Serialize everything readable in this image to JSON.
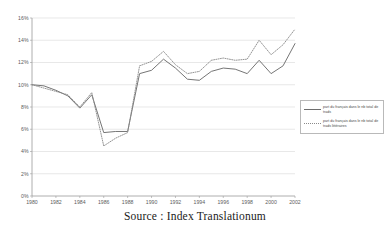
{
  "caption": "Source : Index Translationum",
  "legend": {
    "entries": [
      {
        "label": "part du français dans le nb total de trads",
        "style": "solid",
        "color": "#6e6e6e"
      },
      {
        "label": "part du français dans le nb total de trads littéraires",
        "style": "dotted",
        "color": "#8a8a8a"
      }
    ]
  },
  "chart_data": {
    "type": "line",
    "title": "",
    "subtitle": "",
    "xlabel": "",
    "ylabel": "",
    "xlim": [
      1980,
      2002
    ],
    "ylim": [
      0,
      16
    ],
    "grid": true,
    "grid_axis": "y",
    "legend_position": "right",
    "y_tick_labels": [
      "0%",
      "2%",
      "4%",
      "6%",
      "8%",
      "10%",
      "12%",
      "14%",
      "16%"
    ],
    "y_tick_values": [
      0,
      2,
      4,
      6,
      8,
      10,
      12,
      14,
      16
    ],
    "x_tick_labels": [
      "1980",
      "1982",
      "1984",
      "1986",
      "1988",
      "1990",
      "1992",
      "1994",
      "1996",
      "1998",
      "2000",
      "2002"
    ],
    "x_tick_values": [
      1980,
      1982,
      1984,
      1986,
      1988,
      1990,
      1992,
      1994,
      1996,
      1998,
      2000,
      2002
    ],
    "x": [
      1980,
      1981,
      1982,
      1983,
      1984,
      1985,
      1986,
      1987,
      1988,
      1989,
      1990,
      1991,
      1992,
      1993,
      1994,
      1995,
      1996,
      1997,
      1998,
      1999,
      2000,
      2001,
      2002
    ],
    "series": [
      {
        "name": "part du français dans le nb total de trads",
        "style": "solid",
        "color": "#6e6e6e",
        "values": [
          10.0,
          9.9,
          9.5,
          9.0,
          7.9,
          9.1,
          5.7,
          5.8,
          5.8,
          11.0,
          11.3,
          12.3,
          11.5,
          10.5,
          10.4,
          11.2,
          11.5,
          11.4,
          11.0,
          12.2,
          11.0,
          11.7,
          13.7
        ]
      },
      {
        "name": "part du français dans le nb total de trads littéraires",
        "style": "dotted",
        "color": "#8a8a8a",
        "values": [
          10.0,
          9.7,
          9.4,
          9.1,
          8.0,
          9.3,
          4.5,
          5.2,
          5.7,
          11.7,
          12.1,
          13.0,
          11.8,
          11.0,
          11.2,
          12.2,
          12.4,
          12.2,
          12.3,
          14.0,
          12.7,
          13.6,
          15.0
        ]
      }
    ]
  }
}
